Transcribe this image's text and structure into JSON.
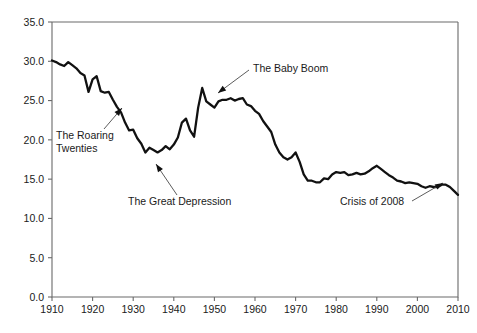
{
  "chart_data": {
    "type": "line",
    "title": "",
    "subtitle": "",
    "xlabel": "",
    "ylabel": "",
    "xlim": [
      1910,
      2010
    ],
    "ylim": [
      0.0,
      35.0
    ],
    "grid": false,
    "legend": "none",
    "y_ticks": [
      "0.0",
      "5.0",
      "10.0",
      "15.0",
      "20.0",
      "25.0",
      "30.0",
      "35.0"
    ],
    "y_tick_values": [
      0.0,
      5.0,
      10.0,
      15.0,
      20.0,
      25.0,
      30.0,
      35.0
    ],
    "x_ticks": [
      "1910",
      "1920",
      "1930",
      "1940",
      "1950",
      "1960",
      "1970",
      "1980",
      "1990",
      "2000",
      "2010"
    ],
    "x_tick_values": [
      1910,
      1920,
      1930,
      1940,
      1950,
      1960,
      1970,
      1980,
      1990,
      2000,
      2010
    ],
    "series": [
      {
        "name": "Birth rate",
        "color": "#111111",
        "x": [
          1910,
          1911,
          1912,
          1913,
          1914,
          1915,
          1916,
          1917,
          1918,
          1919,
          1920,
          1921,
          1922,
          1923,
          1924,
          1925,
          1926,
          1927,
          1928,
          1929,
          1930,
          1931,
          1932,
          1933,
          1934,
          1935,
          1936,
          1937,
          1938,
          1939,
          1940,
          1941,
          1942,
          1943,
          1944,
          1945,
          1946,
          1947,
          1948,
          1949,
          1950,
          1951,
          1952,
          1953,
          1954,
          1955,
          1956,
          1957,
          1958,
          1959,
          1960,
          1961,
          1962,
          1963,
          1964,
          1965,
          1966,
          1967,
          1968,
          1969,
          1970,
          1971,
          1972,
          1973,
          1974,
          1975,
          1976,
          1977,
          1978,
          1979,
          1980,
          1981,
          1982,
          1983,
          1984,
          1985,
          1986,
          1987,
          1988,
          1989,
          1990,
          1991,
          1992,
          1993,
          1994,
          1995,
          1996,
          1997,
          1998,
          1999,
          2000,
          2001,
          2002,
          2003,
          2004,
          2005,
          2006,
          2007,
          2008,
          2009,
          2010
        ],
        "values": [
          30.1,
          29.9,
          29.6,
          29.4,
          29.9,
          29.5,
          29.1,
          28.5,
          28.2,
          26.1,
          27.7,
          28.1,
          26.2,
          26.0,
          26.1,
          25.1,
          24.2,
          23.5,
          22.2,
          21.2,
          21.3,
          20.2,
          19.5,
          18.4,
          19.0,
          18.7,
          18.4,
          18.7,
          19.2,
          18.8,
          19.4,
          20.3,
          22.2,
          22.7,
          21.2,
          20.4,
          24.1,
          26.6,
          24.9,
          24.5,
          24.1,
          24.9,
          25.1,
          25.1,
          25.3,
          25.0,
          25.2,
          25.3,
          24.5,
          24.3,
          23.7,
          23.3,
          22.4,
          21.7,
          21.0,
          19.4,
          18.4,
          17.8,
          17.5,
          17.8,
          18.4,
          17.2,
          15.6,
          14.8,
          14.8,
          14.6,
          14.6,
          15.1,
          15.0,
          15.6,
          15.9,
          15.8,
          15.9,
          15.5,
          15.6,
          15.8,
          15.6,
          15.7,
          16.0,
          16.4,
          16.7,
          16.3,
          15.9,
          15.5,
          15.2,
          14.8,
          14.7,
          14.5,
          14.6,
          14.5,
          14.4,
          14.1,
          13.9,
          14.1,
          14.0,
          14.0,
          14.3,
          14.3,
          14.0,
          13.5,
          13.0
        ]
      }
    ],
    "annotations": [
      {
        "id": "roaring-twenties",
        "text_lines": [
          "The Roaring",
          "Twenties"
        ],
        "text_x": 56,
        "text_y": 139,
        "line": {
          "x1": 104,
          "y1": 129,
          "x2": 122,
          "y2": 108
        },
        "arrow": {
          "x": 122,
          "y": 108,
          "angle": -49
        }
      },
      {
        "id": "great-depression",
        "text_lines": [
          "The Great Depression"
        ],
        "text_x": 128,
        "text_y": 205,
        "line": {
          "x1": 177,
          "y1": 195,
          "x2": 156,
          "y2": 164
        },
        "arrow": {
          "x": 156,
          "y": 164,
          "angle": -124
        }
      },
      {
        "id": "baby-boom",
        "text_lines": [
          "The Baby Boom"
        ],
        "text_x": 253,
        "text_y": 72,
        "line": {
          "x1": 249,
          "y1": 70,
          "x2": 218,
          "y2": 93
        },
        "arrow": {
          "x": 218,
          "y": 93,
          "angle": 143
        }
      },
      {
        "id": "crisis-2008",
        "text_lines": [
          "Crisis of 2008"
        ],
        "text_x": 340,
        "text_y": 205,
        "line": {
          "x1": 412,
          "y1": 201,
          "x2": 443,
          "y2": 183
        },
        "arrow": {
          "x": 443,
          "y": 183,
          "angle": -30
        }
      }
    ]
  },
  "plot": {
    "left": 52,
    "right": 458,
    "top": 22,
    "bottom": 297,
    "axis_color": "#6a6a6a",
    "line_color": "#111111",
    "background": "#ffffff"
  }
}
